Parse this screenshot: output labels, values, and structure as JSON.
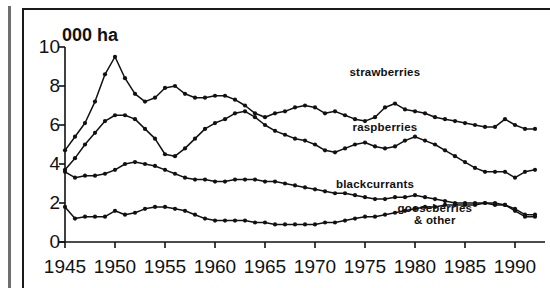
{
  "axis": {
    "y_unit_label": "000 ha",
    "y_ticks": [
      "0",
      "2",
      "4",
      "6",
      "8",
      "10"
    ],
    "x_ticks": [
      "1945",
      "1950",
      "1955",
      "1960",
      "1965",
      "1970",
      "1975",
      "1980",
      "1985",
      "1990"
    ]
  },
  "labels": {
    "strawberries": "strawberries",
    "raspberries": "raspberries",
    "blackcurrants": "blackcurrants",
    "gooseberries_line1": "gooseberries",
    "gooseberries_line2": "& other"
  },
  "chart_data": {
    "type": "line",
    "title": "",
    "subtitle": "",
    "xlabel": "",
    "ylabel": "000 ha",
    "xlim": [
      1945,
      1992
    ],
    "ylim": [
      0,
      10
    ],
    "grid": false,
    "legend": "inline-annotations",
    "marker": "filled-circle",
    "line_color": "#111111",
    "x": [
      1945,
      1946,
      1947,
      1948,
      1949,
      1950,
      1951,
      1952,
      1953,
      1954,
      1955,
      1956,
      1957,
      1958,
      1959,
      1960,
      1961,
      1962,
      1963,
      1964,
      1965,
      1966,
      1967,
      1968,
      1969,
      1970,
      1971,
      1972,
      1973,
      1974,
      1975,
      1976,
      1977,
      1978,
      1979,
      1980,
      1981,
      1982,
      1983,
      1984,
      1985,
      1986,
      1987,
      1988,
      1989,
      1990,
      1991,
      1992
    ],
    "series": [
      {
        "name": "strawberries",
        "values": [
          4.7,
          5.4,
          6.1,
          7.2,
          8.6,
          9.5,
          8.4,
          7.6,
          7.2,
          7.4,
          7.9,
          8.0,
          7.6,
          7.4,
          7.4,
          7.5,
          7.5,
          7.3,
          7.0,
          6.6,
          6.4,
          6.6,
          6.7,
          6.9,
          7.0,
          6.9,
          6.6,
          6.7,
          6.5,
          6.3,
          6.2,
          6.4,
          6.9,
          7.1,
          6.8,
          6.7,
          6.6,
          6.4,
          6.3,
          6.2,
          6.1,
          6.0,
          5.9,
          5.9,
          6.3,
          6.0,
          5.8,
          5.8
        ],
        "label_pos": {
          "x": 1977,
          "y": 8.7
        }
      },
      {
        "name": "raspberries",
        "values": [
          3.7,
          4.3,
          5.0,
          5.6,
          6.2,
          6.5,
          6.5,
          6.3,
          5.8,
          5.3,
          4.5,
          4.4,
          4.8,
          5.3,
          5.8,
          6.1,
          6.3,
          6.6,
          6.7,
          6.4,
          6.0,
          5.7,
          5.5,
          5.3,
          5.2,
          5.0,
          4.7,
          4.6,
          4.8,
          5.0,
          5.1,
          4.9,
          4.8,
          4.9,
          5.2,
          5.4,
          5.2,
          5.0,
          4.7,
          4.4,
          4.1,
          3.8,
          3.6,
          3.6,
          3.6,
          3.3,
          3.6,
          3.7
        ],
        "label_pos": {
          "x": 1977,
          "y": 5.9
        }
      },
      {
        "name": "blackcurrants",
        "values": [
          3.6,
          3.3,
          3.4,
          3.4,
          3.5,
          3.7,
          4.0,
          4.1,
          4.0,
          3.9,
          3.7,
          3.5,
          3.3,
          3.2,
          3.2,
          3.1,
          3.1,
          3.2,
          3.2,
          3.2,
          3.1,
          3.1,
          3.0,
          2.9,
          2.8,
          2.7,
          2.6,
          2.5,
          2.5,
          2.4,
          2.3,
          2.2,
          2.2,
          2.3,
          2.3,
          2.4,
          2.3,
          2.2,
          2.1,
          2.0,
          2.0,
          2.0,
          2.0,
          1.9,
          1.9,
          1.6,
          1.3,
          1.3
        ],
        "label_pos": {
          "x": 1976,
          "y": 2.95
        }
      },
      {
        "name": "gooseberries & other",
        "values": [
          1.8,
          1.2,
          1.3,
          1.3,
          1.3,
          1.6,
          1.4,
          1.5,
          1.7,
          1.8,
          1.8,
          1.7,
          1.6,
          1.4,
          1.2,
          1.1,
          1.1,
          1.1,
          1.1,
          1.0,
          1.0,
          0.9,
          0.9,
          0.9,
          0.9,
          0.9,
          1.0,
          1.0,
          1.1,
          1.2,
          1.3,
          1.3,
          1.4,
          1.5,
          1.6,
          1.7,
          1.8,
          1.8,
          1.9,
          1.9,
          1.9,
          1.9,
          2.0,
          2.0,
          1.9,
          1.7,
          1.4,
          1.4
        ],
        "label_pos": {
          "x": 1982,
          "y": 1.45
        }
      }
    ]
  }
}
